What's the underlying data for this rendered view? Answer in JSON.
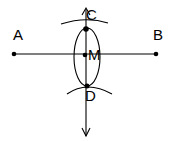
{
  "diagram": {
    "type": "perpendicular-bisector-construction",
    "stroke_color": "#000000",
    "background": "#ffffff",
    "points": {
      "A": {
        "label": "A",
        "x": 14,
        "y": 54
      },
      "B": {
        "label": "B",
        "x": 156,
        "y": 54
      },
      "C": {
        "label": "C",
        "x": 86,
        "y": 29
      },
      "M": {
        "label": "M",
        "x": 85,
        "y": 55
      },
      "D": {
        "label": "D",
        "x": 87,
        "y": 86
      }
    },
    "segments": [
      {
        "name": "AB",
        "from": "A",
        "to": "B"
      },
      {
        "name": "perpendicular-bisector",
        "through": [
          "C",
          "M",
          "D"
        ],
        "arrows": "both"
      }
    ],
    "arcs": [
      "arc-above-AB-through-C",
      "arc-below-AB-through-D",
      "lens-arcs-between-C-and-D"
    ]
  }
}
